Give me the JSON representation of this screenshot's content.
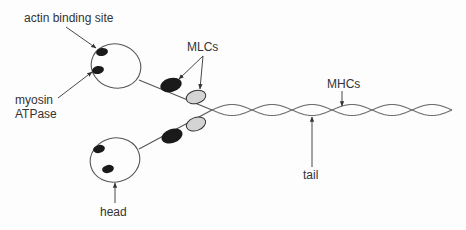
{
  "labels": {
    "actin_binding_site": "actin binding site",
    "myosin_atpase_line1": "myosin",
    "myosin_atpase_line2": "ATPase",
    "mlcs": "MLCs",
    "mhcs": "MHCs",
    "tail": "tail",
    "head": "head"
  },
  "colors": {
    "essential_light_chain": "#1a1a1a",
    "regulatory_light_chain": "#d4d4d4",
    "outline": "#555555",
    "text": "#333333"
  },
  "helix": {
    "crossings": 6
  }
}
